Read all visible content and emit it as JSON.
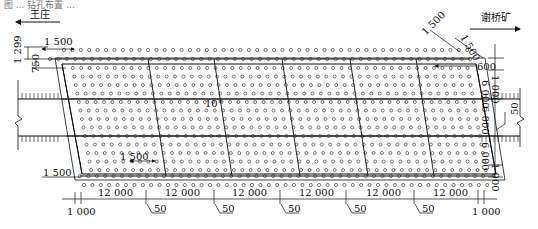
{
  "figure": {
    "caption_partial": "图 ... 钻孔布置 ...",
    "direction_left": "王庄",
    "direction_right": "谢桥矿",
    "angle_label": "10°",
    "dimensions": {
      "top_spacing_left": "1 500",
      "top_offset_left_a": "1 299",
      "top_offset_left_b": "750",
      "top_right_diag_a": "1 500",
      "top_right_diag_b": "1 500",
      "top_right_600": "600",
      "right_1000_top": "1 000",
      "right_6000_a": "6 000",
      "right_6000_b": "6 000",
      "right_6000_c": "6 000",
      "right_50": "50",
      "right_1000_bottom": "1 000",
      "inner_1500": "1 500",
      "bottom_left_1500": "1 500",
      "bottom_spans": [
        "12 000",
        "12 000",
        "12 000",
        "12 000",
        "12 000",
        "12 000"
      ],
      "bottom_ticks_50": [
        "50",
        "50",
        "50",
        "50",
        "50"
      ],
      "bottom_left_1000": "1 000",
      "bottom_right_1000": "1 000"
    }
  }
}
